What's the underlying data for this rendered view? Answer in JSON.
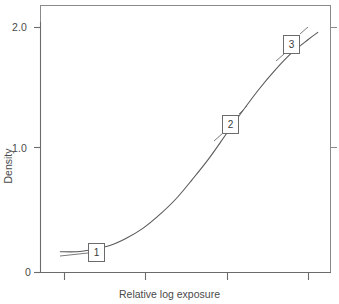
{
  "figure": {
    "name": "characteristic-curve",
    "background_color": "#ffffff",
    "line_color": "#5a5a5a",
    "text_color": "#4a4a4a"
  },
  "chart_data": {
    "type": "line",
    "title": "",
    "subtitle": "",
    "xlabel": "Relative log exposure",
    "ylabel": "Density",
    "xlim": [
      0,
      4.4
    ],
    "ylim": [
      0,
      2.15
    ],
    "grid": false,
    "legend": null,
    "y_ticks": [
      0,
      1.0,
      2.0
    ],
    "y_tick_labels": [
      "0",
      "1.0",
      "2.0"
    ],
    "x_ticks": [
      1,
      2,
      3,
      4
    ],
    "x_tick_labels": [
      "",
      "",
      "",
      ""
    ],
    "series": [
      {
        "name": "characteristic curve",
        "x": [
          0.3,
          0.55,
          0.8,
          1.05,
          1.3,
          1.55,
          1.8,
          2.05,
          2.3,
          2.55,
          2.8,
          3.05,
          3.3,
          3.55,
          3.8,
          4.05,
          4.2
        ],
        "y": [
          0.17,
          0.17,
          0.19,
          0.22,
          0.28,
          0.36,
          0.47,
          0.6,
          0.76,
          0.93,
          1.12,
          1.31,
          1.49,
          1.65,
          1.79,
          1.9,
          1.96
        ]
      }
    ],
    "annotations": [
      {
        "label": "1",
        "x": 0.98,
        "y": 0.22,
        "region": "toe"
      },
      {
        "label": "2",
        "x": 2.62,
        "y": 1.18,
        "region": "straight-line"
      },
      {
        "label": "3",
        "x": 3.82,
        "y": 1.82,
        "region": "shoulder"
      }
    ]
  },
  "callouts": {
    "one": "1",
    "two": "2",
    "three": "3"
  },
  "axis": {
    "y_label": "Density",
    "x_label": "Relative log exposure",
    "y_tick_2": "2.0",
    "y_tick_1": "1.0",
    "y_tick_0": "0"
  }
}
